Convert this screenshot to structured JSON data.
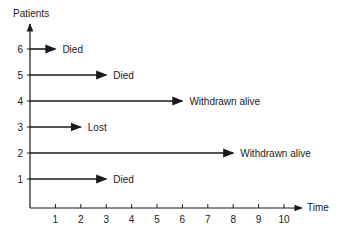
{
  "chart_data": {
    "type": "timeline",
    "title": "",
    "xlabel": "Time",
    "ylabel": "Patients",
    "x_ticks": [
      1,
      2,
      3,
      4,
      5,
      6,
      7,
      8,
      9,
      10
    ],
    "y_ticks": [
      1,
      2,
      3,
      4,
      5,
      6
    ],
    "xlim": [
      0,
      10.5
    ],
    "ylim": [
      0,
      7
    ],
    "grid": false,
    "series": [
      {
        "patient": 6,
        "start": 0,
        "end": 1,
        "outcome": "Died"
      },
      {
        "patient": 5,
        "start": 0,
        "end": 3,
        "outcome": "Died"
      },
      {
        "patient": 4,
        "start": 0,
        "end": 6,
        "outcome": "Withdrawn alive"
      },
      {
        "patient": 3,
        "start": 0,
        "end": 2,
        "outcome": "Lost"
      },
      {
        "patient": 2,
        "start": 0,
        "end": 8,
        "outcome": "Withdrawn alive"
      },
      {
        "patient": 1,
        "start": 0,
        "end": 3,
        "outcome": "Died"
      }
    ]
  },
  "colors": {
    "ink": "#1a1a1a",
    "background": "#ffffff"
  }
}
